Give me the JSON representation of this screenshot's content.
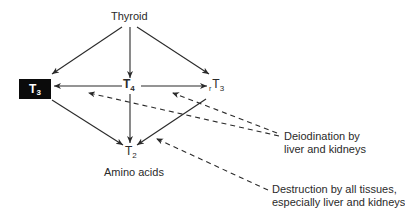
{
  "diagram": {
    "type": "thyroid-hormone-metabolism-flow",
    "nodes": {
      "thyroid": {
        "label": "Thyroid"
      },
      "t3": {
        "base": "T",
        "sub": "3",
        "highlighted": true
      },
      "t4": {
        "base": "T",
        "sub": "4"
      },
      "rt3": {
        "prefix": "r",
        "base": "T",
        "sub": "3"
      },
      "t2": {
        "base": "T",
        "sub": "2"
      },
      "amino_acids": {
        "label": "Amino acids"
      }
    },
    "annotations": {
      "deiodination": {
        "line1": "Deiodination by",
        "line2": "liver and kidneys"
      },
      "destruction": {
        "line1": "Destruction by all tissues,",
        "line2": "especially liver and kidneys"
      }
    },
    "edges": [
      {
        "from": "Thyroid",
        "to": "T3",
        "style": "solid"
      },
      {
        "from": "Thyroid",
        "to": "T4",
        "style": "solid"
      },
      {
        "from": "Thyroid",
        "to": "rT3",
        "style": "solid"
      },
      {
        "from": "T4",
        "to": "T3",
        "style": "solid"
      },
      {
        "from": "T4",
        "to": "rT3",
        "style": "solid"
      },
      {
        "from": "T4",
        "to": "T2",
        "style": "solid"
      },
      {
        "from": "T3",
        "to": "T2",
        "style": "solid"
      },
      {
        "from": "rT3",
        "to": "T2",
        "style": "solid"
      },
      {
        "from": "Deiodination by liver and kidneys",
        "to": "T4→T3 edge",
        "style": "dashed"
      },
      {
        "from": "Deiodination by liver and kidneys",
        "to": "T4→rT3 edge",
        "style": "dashed"
      },
      {
        "from": "Destruction by all tissues, especially liver and kidneys",
        "to": "T2",
        "style": "dashed"
      }
    ],
    "colors": {
      "line": "#2a2a2a",
      "highlight_fill": "#0b0b0b",
      "highlight_text": "#ffffff",
      "background": "#ffffff"
    }
  }
}
